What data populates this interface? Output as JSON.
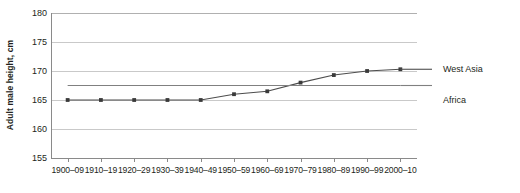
{
  "chart_data": {
    "type": "line",
    "title": "",
    "xlabel": "",
    "ylabel": "Adult male height, cm",
    "ylim": [
      155,
      180
    ],
    "yticks": [
      155,
      160,
      165,
      170,
      175,
      180
    ],
    "grid": true,
    "legend_position": "right",
    "categories": [
      "1900–09",
      "1910–19",
      "1920–29",
      "1930–39",
      "1940–49",
      "1950–59",
      "1960–69",
      "1970–79",
      "1980–89",
      "1990–99",
      "2000–10"
    ],
    "series": [
      {
        "name": "West Asia",
        "color": "#4d4d4d",
        "markers": true,
        "values": [
          165.0,
          165.0,
          165.0,
          165.0,
          165.0,
          166.0,
          166.5,
          168.0,
          169.3,
          170.0,
          170.3
        ]
      },
      {
        "name": "Africa",
        "color": "#808080",
        "markers": false,
        "values": [
          167.5,
          167.5,
          167.5,
          167.5,
          167.5,
          167.5,
          167.5,
          167.5,
          167.5,
          167.5,
          167.5
        ]
      }
    ]
  },
  "legend": {
    "items": [
      {
        "label": "West Asia"
      },
      {
        "label": "Africa"
      }
    ]
  }
}
